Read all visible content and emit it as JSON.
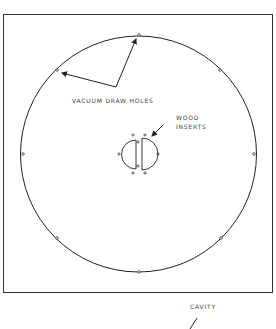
{
  "diagram": {
    "labels": {
      "vacuum_holes": "VACUUM DRAW HOLES",
      "wood_line1": "WOOD",
      "wood_line2": "INSERTS",
      "cavity": "CAVITY"
    },
    "colors": {
      "stroke": "#222222",
      "text": "#444444"
    }
  }
}
